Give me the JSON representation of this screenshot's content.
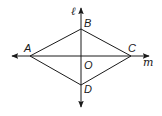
{
  "diagram": {
    "type": "geometry-rhombus-with-perpendicular-lines",
    "lines": {
      "vertical": {
        "label": "ℓ",
        "x": 81,
        "y_start": 7,
        "y_end": 108
      },
      "horizontal": {
        "label": "m",
        "y": 56,
        "x_start": 11,
        "x_end": 150
      }
    },
    "points": {
      "A": {
        "label": "A",
        "x": 30,
        "y": 56
      },
      "B": {
        "label": "B",
        "x": 81,
        "y": 29
      },
      "C": {
        "label": "C",
        "x": 131,
        "y": 56
      },
      "D": {
        "label": "D",
        "x": 81,
        "y": 85
      },
      "O": {
        "label": "O",
        "x": 81,
        "y": 56
      }
    },
    "segments": [
      "AB",
      "BC",
      "CD",
      "DA"
    ],
    "stroke_color": "#1a1a1a"
  }
}
